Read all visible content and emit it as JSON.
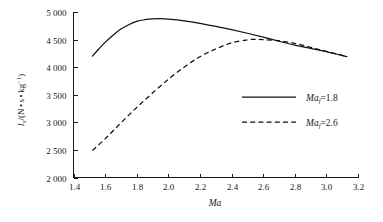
{
  "chart_data": {
    "type": "line",
    "title": "",
    "xlabel": "Ma",
    "ylabel": "I_s/(N · s · kg^-1)",
    "ylabel_parts": {
      "symbol": "I",
      "symbol_sub": "s",
      "unit_open": "/(N",
      "dot1": "•",
      "unit_s": "s",
      "dot2": "•",
      "unit_kg": "kg",
      "unit_exp": "−1",
      "unit_close": ")"
    },
    "xlim": [
      1.4,
      3.2
    ],
    "ylim": [
      2000,
      5000
    ],
    "xticks": [
      1.4,
      1.6,
      1.8,
      2.0,
      2.2,
      2.4,
      2.6,
      2.8,
      3.0,
      3.2
    ],
    "xticklabels": [
      "1.4",
      "1.6",
      "1.8",
      "2.0",
      "2.2",
      "2.4",
      "2.6",
      "2.8",
      "3.0",
      "3.2"
    ],
    "yticks": [
      2000,
      2500,
      3000,
      3500,
      4000,
      4500,
      5000
    ],
    "yticklabels": [
      "2 000",
      "2 500",
      "3 000",
      "3 500",
      "4 000",
      "4 500",
      "5 000"
    ],
    "grid": false,
    "legend_position": "center-right",
    "axis_style": "left-and-bottom-only",
    "series": [
      {
        "name": "Ma_f=1.8",
        "label_symbol": "Ma",
        "label_sub": "f",
        "label_value": "=1.8",
        "style": "solid",
        "color": "#111111",
        "x": [
          1.52,
          1.56,
          1.6,
          1.65,
          1.7,
          1.75,
          1.8,
          1.85,
          1.9,
          1.95,
          2.0,
          2.1,
          2.2,
          2.3,
          2.4,
          2.5,
          2.6,
          2.7,
          2.8,
          2.9,
          3.0,
          3.13
        ],
        "y": [
          4200,
          4330,
          4450,
          4580,
          4690,
          4770,
          4830,
          4860,
          4875,
          4878,
          4870,
          4840,
          4795,
          4740,
          4680,
          4615,
          4545,
          4470,
          4400,
          4340,
          4280,
          4190
        ]
      },
      {
        "name": "Ma_f=2.6",
        "label_symbol": "Ma",
        "label_sub": "f",
        "label_value": "=2.6",
        "style": "dashed",
        "color": "#111111",
        "x": [
          1.52,
          1.6,
          1.7,
          1.8,
          1.9,
          2.0,
          2.1,
          2.2,
          2.3,
          2.4,
          2.5,
          2.55,
          2.6,
          2.7,
          2.8,
          2.9,
          3.0,
          3.13
        ],
        "y": [
          2490,
          2700,
          2990,
          3270,
          3530,
          3780,
          4000,
          4190,
          4330,
          4440,
          4495,
          4505,
          4500,
          4480,
          4430,
          4360,
          4285,
          4190
        ]
      }
    ],
    "legend": [
      {
        "label_symbol": "Ma",
        "label_sub": "f",
        "label_value": "=1.8",
        "style": "solid"
      },
      {
        "label_symbol": "Ma",
        "label_sub": "f",
        "label_value": "=2.6",
        "style": "dashed"
      }
    ]
  },
  "background_text": "A faint page-bleed of dense CJK body text is visible behind the plot area."
}
